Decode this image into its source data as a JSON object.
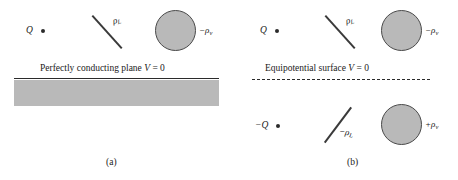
{
  "figure": {
    "type": "physics-diagram",
    "topic": "method-of-images",
    "colors": {
      "ink": "#2b2b2b",
      "fill_gray": "#b9b9b9",
      "background": "#ffffff"
    }
  },
  "panel_a": {
    "subcaption": "(a)",
    "point_charge_label": "Q",
    "line_charge_label": "ρ",
    "line_charge_subscript": "L",
    "volume_charge_sign": "−",
    "volume_charge_label": "ρ",
    "volume_charge_subscript": "v",
    "plane_caption_prefix": "Perfectly conducting plane ",
    "plane_caption_symbol": "V",
    "plane_caption_suffix": " = 0"
  },
  "panel_b": {
    "subcaption": "(b)",
    "plane_caption_prefix": "Equipotential surface ",
    "plane_caption_symbol": "V",
    "plane_caption_suffix": " = 0",
    "upper": {
      "point_charge_label": "Q",
      "line_charge_label": "ρ",
      "line_charge_subscript": "L",
      "volume_charge_sign": "−",
      "volume_charge_label": "ρ",
      "volume_charge_subscript": "v"
    },
    "lower": {
      "point_charge_label": "−Q",
      "line_charge_sign": "−",
      "line_charge_label": "ρ",
      "line_charge_subscript": "L",
      "volume_charge_sign": "+",
      "volume_charge_label": "ρ",
      "volume_charge_subscript": "v"
    }
  }
}
